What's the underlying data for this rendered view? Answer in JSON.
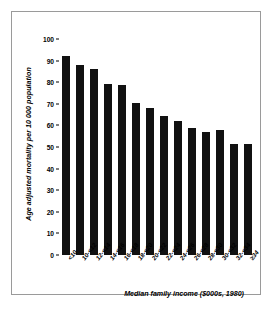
{
  "figure": {
    "frame_color": "#9a9a9a",
    "background": "#ffffff",
    "bar_color": "#111111"
  },
  "chart_data": {
    "type": "bar",
    "title": "",
    "xlabel": "Median family income ($000s, 1980)",
    "ylabel": "Age adjusted mortality per 10 000 population",
    "categories": [
      "<10",
      "10-<12",
      "12-<14",
      "14-<16",
      "16-<18",
      "18-<20",
      "20-<22",
      "22-<24",
      "24-<26",
      "26-<28",
      "28-<30",
      "30-<32",
      "32-<34",
      "≥34"
    ],
    "values": [
      92,
      88,
      86,
      79,
      78.5,
      70.5,
      68,
      64.5,
      62,
      59,
      57,
      58,
      51.5,
      51.5
    ],
    "ylim": [
      0,
      100
    ],
    "ytick_values": [
      0,
      10,
      20,
      30,
      40,
      50,
      60,
      70,
      80,
      90,
      100
    ],
    "ytick_labels": [
      "0",
      "10",
      "20",
      "30",
      "40",
      "50",
      "60",
      "70",
      "80",
      "90",
      "100"
    ],
    "grid": false,
    "legend": null,
    "legend_position": "none",
    "orientation": "vertical"
  }
}
